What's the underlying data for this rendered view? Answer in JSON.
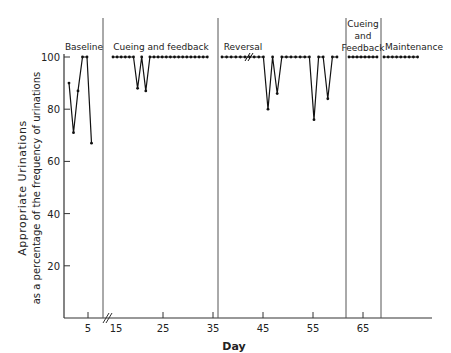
{
  "chart_data": {
    "type": "line",
    "title": "",
    "xlabel": "Day",
    "ylabel": "Appropriate Urinations",
    "ylabel2": "as a percentage of the frequency of urinations",
    "ylim": [
      0,
      100
    ],
    "yticks": [
      "20",
      "40",
      "60",
      "80",
      "100"
    ],
    "xticks": [
      "5",
      "15",
      "25",
      "35",
      "45",
      "55",
      "65"
    ],
    "phases": [
      {
        "name": "Baseline",
        "label_lines": [
          "Baseline"
        ],
        "values": [
          90,
          71,
          87,
          100,
          100,
          67
        ]
      },
      {
        "name": "Cueing and feedback",
        "label_lines": [
          "Cueing and feedback"
        ],
        "values": [
          100,
          100,
          100,
          100,
          100,
          100,
          88,
          100,
          87,
          100,
          100,
          100,
          100,
          100,
          100,
          100,
          100,
          100,
          100,
          100,
          100,
          100,
          100,
          100
        ]
      },
      {
        "name": "Reversal",
        "label_lines": [
          "Reversal"
        ],
        "values": [
          100,
          100,
          100,
          100,
          100,
          100,
          100,
          100,
          100,
          100,
          80,
          100,
          86,
          100,
          100,
          100,
          100,
          100,
          100,
          100,
          76,
          100,
          100,
          84,
          100,
          100
        ]
      },
      {
        "name": "Cueing and Feedback",
        "label_lines": [
          "Cueing",
          "and",
          "Feedback"
        ],
        "values": [
          100,
          100,
          100,
          100,
          100,
          100,
          100,
          100
        ]
      },
      {
        "name": "Maintenance",
        "label_lines": [
          "Maintenance"
        ],
        "values": [
          100,
          100,
          100,
          100,
          100,
          100,
          100,
          100,
          100
        ]
      }
    ]
  }
}
